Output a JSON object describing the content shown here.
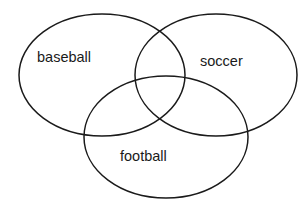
{
  "diagram": {
    "type": "venn",
    "stroke_color": "#1a1a1a",
    "background_color": "#ffffff",
    "sets": [
      {
        "id": "baseball",
        "label": "baseball",
        "cx": 102,
        "cy": 75,
        "rx": 83,
        "ry": 61,
        "label_x": 37,
        "label_y": 62
      },
      {
        "id": "soccer",
        "label": "soccer",
        "cx": 216,
        "cy": 75,
        "rx": 81,
        "ry": 61,
        "label_x": 200,
        "label_y": 66
      },
      {
        "id": "football",
        "label": "football",
        "cx": 166,
        "cy": 137,
        "rx": 82,
        "ry": 61,
        "label_x": 120,
        "label_y": 161
      }
    ]
  }
}
